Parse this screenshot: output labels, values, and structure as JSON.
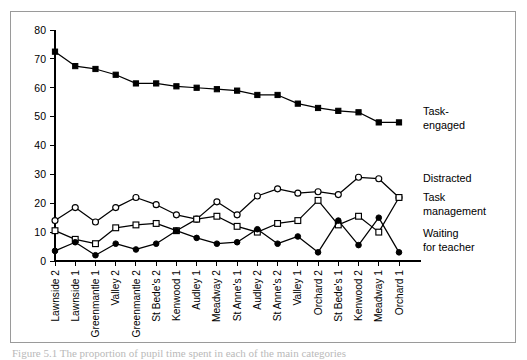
{
  "figure": {
    "caption": "Figure 5.1 The proportion of pupil time spent in each of the main categories",
    "frame_color": "#9a9a9a",
    "ink_color": "#000000"
  },
  "chart_data": {
    "type": "line",
    "title": "",
    "xlabel": "",
    "ylabel": "",
    "ylim": [
      0,
      80
    ],
    "ytick_step": 10,
    "yticks": [
      0,
      10,
      20,
      30,
      40,
      50,
      60,
      70,
      80
    ],
    "grid": false,
    "legend_position": "right",
    "categories": [
      "Lawnside 2",
      "Lawnside 1",
      "Greenmantle 1",
      "Valley 2",
      "Greenmantle 2",
      "St Bede's 2",
      "Kenwood 1",
      "Audley 1",
      "Meadway 2",
      "St Anne's 1",
      "Audley 2",
      "St Anne's 2",
      "Valley 1",
      "Orchard 2",
      "St Bede's 1",
      "Kenwood 2",
      "Meadway 1",
      "Orchard 1"
    ],
    "series": [
      {
        "name": "Task-engaged",
        "marker": "filled-square",
        "values": [
          72.5,
          67.5,
          66.5,
          64.5,
          61.5,
          61.5,
          60.5,
          60.0,
          59.5,
          59.0,
          57.5,
          57.5,
          54.5,
          53.0,
          52.0,
          51.5,
          48.0,
          48.0
        ]
      },
      {
        "name": "Distracted",
        "marker": "open-circle",
        "values": [
          14.0,
          18.5,
          13.5,
          18.5,
          22.0,
          19.5,
          16.0,
          14.5,
          20.5,
          16.0,
          22.5,
          25.0,
          23.5,
          24.0,
          23.0,
          29.0,
          28.5,
          22.0
        ]
      },
      {
        "name": "Task management",
        "marker": "open-square",
        "values": [
          10.5,
          7.5,
          6.0,
          11.5,
          12.5,
          13.0,
          10.5,
          14.5,
          15.5,
          12.0,
          10.0,
          13.0,
          14.0,
          21.0,
          12.5,
          15.5,
          10.0,
          22.0
        ]
      },
      {
        "name": "Waiting for teacher",
        "marker": "filled-circle",
        "values": [
          3.5,
          6.5,
          2.0,
          6.0,
          4.0,
          6.0,
          10.5,
          8.0,
          6.0,
          6.5,
          11.0,
          6.0,
          8.5,
          3.0,
          14.0,
          5.5,
          15.0,
          3.0
        ]
      }
    ],
    "legend_labels": [
      {
        "id": "task-engaged",
        "line1": "Task-",
        "line2": "engaged"
      },
      {
        "id": "distracted",
        "line1": "Distracted",
        "line2": ""
      },
      {
        "id": "task-management",
        "line1": "Task",
        "line2": "management"
      },
      {
        "id": "waiting-for-teacher",
        "line1": "Waiting",
        "line2": "for teacher"
      }
    ]
  }
}
